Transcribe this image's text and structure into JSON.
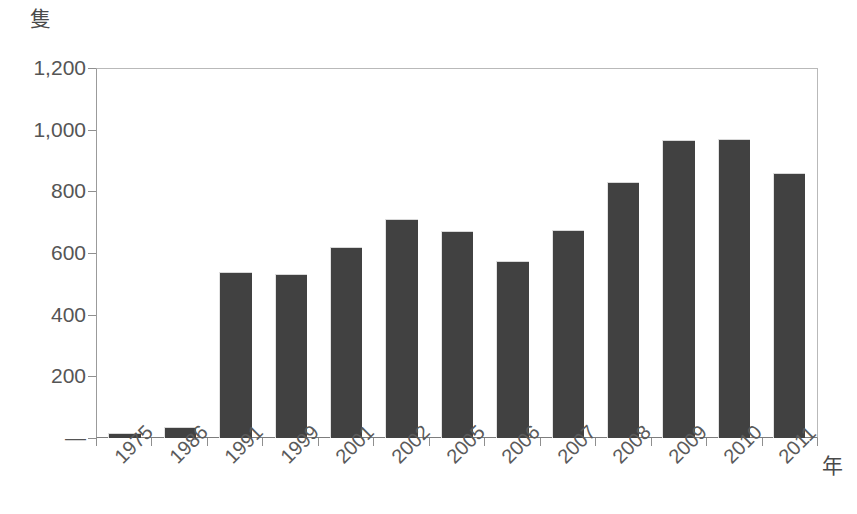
{
  "chart_data": {
    "type": "bar",
    "title": "",
    "xlabel": "年",
    "ylabel": "隻",
    "categories": [
      "1975",
      "1986",
      "1991",
      "1999",
      "2001",
      "2002",
      "2005",
      "2006",
      "2007",
      "2008",
      "2009",
      "2010",
      "2011"
    ],
    "values": [
      15,
      35,
      540,
      532,
      620,
      710,
      670,
      575,
      675,
      830,
      968,
      970,
      860
    ],
    "ylim": [
      0,
      1200
    ],
    "y_ticks": [
      0,
      200,
      400,
      600,
      800,
      1000,
      1200
    ],
    "y_tick_labels": [
      "―",
      "200",
      "400",
      "600",
      "800",
      "1,000",
      "1,200"
    ],
    "grid": false,
    "legend": false,
    "bar_color": "#414141",
    "axis_color": "#8f8f8f",
    "text_color": "#555555"
  }
}
